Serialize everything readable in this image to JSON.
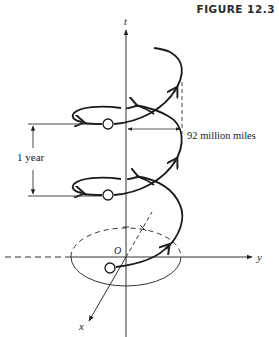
{
  "figure": {
    "title": "FIGURE 12.3",
    "labels": {
      "t_axis": "t",
      "y_axis": "y",
      "x_axis": "x",
      "origin": "O",
      "period": "1 year",
      "radius": "92 million miles"
    },
    "colors": {
      "ink": "#222222",
      "background": "#ffffff"
    }
  }
}
